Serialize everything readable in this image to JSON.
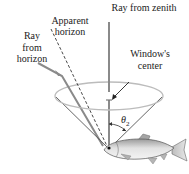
{
  "diagram": {
    "labels": {
      "ray_from_zenith": "Ray from zenith",
      "apparent_horizon_line1": "Apparent",
      "apparent_horizon_line2": "horizon",
      "ray_from_horizon_line1": "Ray",
      "ray_from_horizon_line2": "from",
      "ray_from_horizon_line3": "horizon",
      "windows_center_line1": "Window's",
      "windows_center_line2": "center",
      "angle_symbol": "θ",
      "angle_subscript": "2"
    },
    "colors": {
      "ray_line": "#8a8a8a",
      "cone_line": "#555555",
      "ellipse": "#b5b5b5",
      "dashed_line": "#333333",
      "arrow": "#222222",
      "fish_body": "#c8c8c8",
      "fish_outline": "#555555"
    }
  }
}
